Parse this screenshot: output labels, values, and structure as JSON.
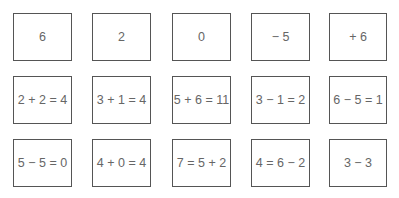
{
  "worksheet": {
    "rows": [
      {
        "cards": [
          "6",
          "2",
          "0",
          "− 5",
          "+ 6"
        ]
      },
      {
        "cards": [
          "2 + 2 = 4",
          "3 + 1 = 4",
          "5 + 6 = 11",
          "3 − 1 = 2",
          "6 − 5 = 1"
        ]
      },
      {
        "cards": [
          "5 − 5 = 0",
          "4 + 0 = 4",
          "7 = 5 + 2",
          "4 = 6 − 2",
          "3 − 3"
        ]
      }
    ]
  }
}
